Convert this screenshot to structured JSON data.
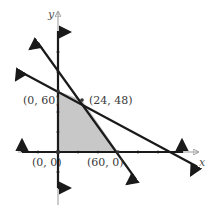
{
  "diagram": {
    "type": "linear-programming-feasible-region",
    "axes": {
      "x_label": "x",
      "y_label": "y"
    },
    "vertices": [
      {
        "label": "(0, 60)",
        "x": 0,
        "y": 60
      },
      {
        "label": "(24, 48)",
        "x": 24,
        "y": 48
      },
      {
        "label": "(0, 0)",
        "x": 0,
        "y": 0
      },
      {
        "label": "(60, 0)",
        "x": 60,
        "y": 0
      }
    ],
    "colors": {
      "region_fill": "#c8c8c8",
      "line": "#1a1a1a",
      "axis": "#999999"
    }
  }
}
